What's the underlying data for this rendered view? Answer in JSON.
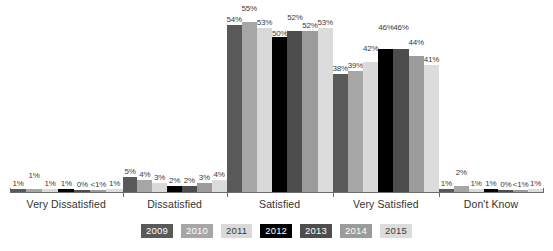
{
  "chart_data": {
    "type": "bar",
    "title": "",
    "subtitle": "",
    "xlabel": "",
    "ylabel": "",
    "ylim": [
      0,
      60
    ],
    "grid": false,
    "legend_position": "bottom",
    "categories": [
      "Very Dissatisfied",
      "Dissatisfied",
      "Satisfied",
      "Very Satisfied",
      "Don't Know"
    ],
    "series": [
      {
        "name": "2009",
        "color": "#595959",
        "text_color": "#ffffff",
        "values": [
          1,
          5,
          54,
          38,
          1
        ],
        "labels": [
          "1%",
          "5%",
          "54%",
          "38%",
          "1%"
        ]
      },
      {
        "name": "2010",
        "color": "#a6a6a6",
        "text_color": "#ffffff",
        "values": [
          1,
          4,
          55,
          39,
          2
        ],
        "labels": [
          "1%",
          "4%",
          "55%",
          "39%",
          "2%"
        ]
      },
      {
        "name": "2011",
        "color": "#d9d9d9",
        "text_color": "#3a3a3a",
        "values": [
          1,
          3,
          53,
          42,
          1
        ],
        "labels": [
          "1%",
          "3%",
          "53%",
          "42%",
          "1%"
        ]
      },
      {
        "name": "2012",
        "color": "#000000",
        "text_color": "#ffffff",
        "values": [
          1,
          2,
          50,
          46,
          1
        ],
        "labels": [
          "1%",
          "2%",
          "50%",
          "46%",
          "1%"
        ]
      },
      {
        "name": "2013",
        "color": "#4d4d4d",
        "text_color": "#ffffff",
        "values": [
          0,
          2,
          52,
          46,
          0
        ],
        "labels": [
          "0%",
          "2%",
          "52%",
          "46%",
          "0%"
        ]
      },
      {
        "name": "2014",
        "color": "#9b9b9b",
        "text_color": "#ffffff",
        "values": [
          0.5,
          3,
          52,
          44,
          0.5
        ],
        "labels": [
          "<1%",
          "3%",
          "52%",
          "44%",
          "<1%"
        ]
      },
      {
        "name": "2015",
        "color": "#dcdcdc",
        "text_color": "#3a3a3a",
        "values": [
          1,
          4,
          53,
          41,
          1
        ],
        "labels": [
          "1%",
          "4%",
          "53%",
          "41%",
          "1%"
        ]
      }
    ]
  },
  "axis": {
    "baseline_visible": true
  },
  "legend": {
    "items": [
      {
        "label": "2009",
        "color": "#595959",
        "text_color": "#ffffff"
      },
      {
        "label": "2010",
        "color": "#a6a6a6",
        "text_color": "#ffffff"
      },
      {
        "label": "2011",
        "color": "#d9d9d9",
        "text_color": "#3a3a3a"
      },
      {
        "label": "2012",
        "color": "#000000",
        "text_color": "#ffffff"
      },
      {
        "label": "2013",
        "color": "#4d4d4d",
        "text_color": "#ffffff"
      },
      {
        "label": "2014",
        "color": "#9b9b9b",
        "text_color": "#ffffff"
      },
      {
        "label": "2015",
        "color": "#dcdcdc",
        "text_color": "#3a3a3a"
      }
    ]
  }
}
